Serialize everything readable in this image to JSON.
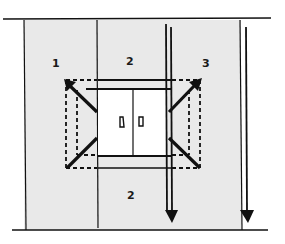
{
  "diagram": {
    "title": "",
    "background_color": "#ffffff",
    "panel_color": "#e8e8e8",
    "line_color": "#111111",
    "window_color": "#ffffff",
    "labels": [
      {
        "id": "zone-1",
        "text": "1",
        "x": 52,
        "y": 58
      },
      {
        "id": "zone-2-top",
        "text": "2",
        "x": 126,
        "y": 56
      },
      {
        "id": "zone-3",
        "text": "3",
        "x": 202,
        "y": 58
      },
      {
        "id": "zone-2-bottom",
        "text": "2",
        "x": 127,
        "y": 190
      }
    ],
    "elements": {
      "window": "double casement window with two handles",
      "left_arrow": "diagonal arrow pointing up-left (opening direction)",
      "right_arrow": "diagonal arrow pointing up-right (opening direction)",
      "dashed_outlines": "dashed rectangles showing swing extents",
      "plumb_lines": "two vertical lines ending in downward arrowheads"
    }
  }
}
